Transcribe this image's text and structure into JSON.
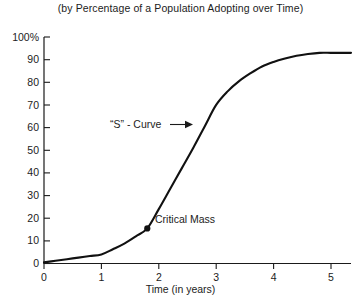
{
  "chart_data": {
    "type": "line",
    "title": "(by Percentage of a Population Adopting over Time)",
    "xlabel": "Time (in years)",
    "ylabel": "",
    "xlim": [
      0,
      5.35
    ],
    "ylim": [
      0,
      100
    ],
    "grid": false,
    "legend": null,
    "x_ticks": [
      "0",
      "1",
      "2",
      "3",
      "4",
      "5"
    ],
    "x_tick_values": [
      0,
      1,
      2,
      3,
      4,
      5
    ],
    "y_ticks": [
      "0",
      "10",
      "20",
      "30",
      "40",
      "50",
      "60",
      "70",
      "80",
      "90",
      "100%"
    ],
    "y_tick_values": [
      0,
      10,
      20,
      30,
      40,
      50,
      60,
      70,
      80,
      90,
      100
    ],
    "series": [
      {
        "name": "Adoption S-Curve",
        "color": "#111111",
        "x": [
          0.0,
          0.2,
          0.4,
          0.6,
          0.8,
          1.0,
          1.2,
          1.4,
          1.6,
          1.8,
          2.0,
          2.2,
          2.4,
          2.6,
          2.8,
          3.0,
          3.2,
          3.4,
          3.6,
          3.8,
          4.0,
          4.2,
          4.4,
          4.6,
          4.8,
          5.0,
          5.2,
          5.35
        ],
        "y": [
          0.5,
          1.2,
          1.9,
          2.6,
          3.3,
          4.0,
          6.3,
          8.8,
          12.0,
          15.5,
          24.0,
          33.0,
          42.0,
          51.0,
          60.5,
          70.0,
          76.0,
          80.5,
          84.0,
          87.0,
          89.0,
          90.5,
          91.7,
          92.5,
          93.0,
          93.0,
          93.0,
          93.0
        ]
      }
    ],
    "annotations": [
      {
        "id": "s-curve",
        "text": "“S” - Curve",
        "has_arrow": true,
        "arrow_direction": "right",
        "points_to_x": 2.55,
        "points_to_y": 50.0
      },
      {
        "id": "critical-mass",
        "text": "Critical Mass",
        "marker": "dot",
        "marker_x": 1.8,
        "marker_y": 15.5
      }
    ]
  },
  "colors": {
    "background": "#ffffff",
    "axis": "#1a1a1a",
    "curve": "#111111",
    "text": "#1c1c1c"
  }
}
